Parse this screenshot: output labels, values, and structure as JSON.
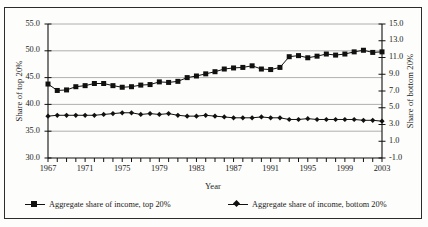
{
  "figure": {
    "background_color": "#fdfdfb",
    "frame_color": "#2b2b2b",
    "series_color": "#111111",
    "gridline_color": "#9a9a9a"
  },
  "labels": {
    "ylabel_left": "Share of top 20%",
    "ylabel_right": "Share of bottom 20%",
    "xlabel": "Year"
  },
  "legend": {
    "top_label": "Aggregate share of income, top 20%",
    "bottom_label": "Aggregate share of income, bottom 20%"
  },
  "chart_data": {
    "type": "line",
    "title": "",
    "xlabel": "Year",
    "ylabel": "Share of top 20%",
    "y2label": "Share of bottom 20%",
    "grid": true,
    "legend_position": "bottom",
    "xlim": [
      1967,
      2003
    ],
    "ylim": [
      30.0,
      55.0
    ],
    "y2lim": [
      -1.0,
      15.0
    ],
    "ytick_labels": [
      "30.0",
      "35.0",
      "40.0",
      "45.0",
      "50.0",
      "55.0"
    ],
    "ytick_values": [
      30.0,
      35.0,
      40.0,
      45.0,
      50.0,
      55.0
    ],
    "y2tick_labels": [
      "-1.0",
      "1.0",
      "3.0",
      "5.0",
      "7.0",
      "9.0",
      "11.0",
      "13.0",
      "15.0"
    ],
    "y2tick_values": [
      -1.0,
      1.0,
      3.0,
      5.0,
      7.0,
      9.0,
      11.0,
      13.0,
      15.0
    ],
    "xtick_labels": [
      "1967",
      "1971",
      "1975",
      "1979",
      "1983",
      "1987",
      "1991",
      "1995",
      "1999",
      "2003"
    ],
    "xtick_values": [
      1967,
      1971,
      1975,
      1979,
      1983,
      1987,
      1991,
      1995,
      1999,
      2003
    ],
    "x": [
      1967,
      1968,
      1969,
      1970,
      1971,
      1972,
      1973,
      1974,
      1975,
      1976,
      1977,
      1978,
      1979,
      1980,
      1981,
      1982,
      1983,
      1984,
      1985,
      1986,
      1987,
      1988,
      1989,
      1990,
      1991,
      1992,
      1993,
      1994,
      1995,
      1996,
      1997,
      1998,
      1999,
      2000,
      2001,
      2002,
      2003
    ],
    "series": [
      {
        "name": "Aggregate share of income, top 20%",
        "axis": "left",
        "marker": "square",
        "values": [
          43.8,
          42.6,
          42.7,
          43.3,
          43.5,
          43.9,
          43.9,
          43.5,
          43.2,
          43.3,
          43.6,
          43.7,
          44.2,
          44.1,
          44.3,
          45.0,
          45.3,
          45.7,
          46.1,
          46.6,
          46.8,
          46.9,
          47.2,
          46.6,
          46.5,
          46.9,
          48.9,
          49.1,
          48.7,
          49.0,
          49.4,
          49.2,
          49.4,
          49.8,
          50.1,
          49.7,
          49.8
        ]
      },
      {
        "name": "Aggregate share of income, bottom 20%",
        "axis": "right",
        "marker": "diamond",
        "values": [
          4.0,
          4.1,
          4.1,
          4.1,
          4.1,
          4.1,
          4.2,
          4.3,
          4.4,
          4.4,
          4.2,
          4.3,
          4.2,
          4.3,
          4.1,
          4.0,
          4.0,
          4.1,
          4.0,
          3.9,
          3.8,
          3.8,
          3.8,
          3.9,
          3.8,
          3.8,
          3.6,
          3.6,
          3.7,
          3.6,
          3.6,
          3.6,
          3.6,
          3.6,
          3.5,
          3.5,
          3.4
        ]
      }
    ]
  }
}
